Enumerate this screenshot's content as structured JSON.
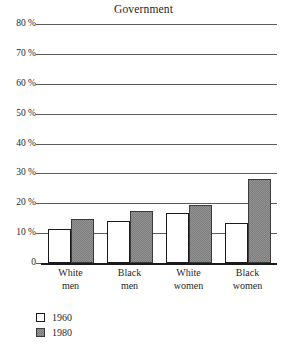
{
  "chart_data": {
    "type": "bar",
    "title": "Government",
    "xlabel": "",
    "ylabel": "",
    "ylim": [
      0,
      80
    ],
    "grid": true,
    "legend_position": "bottom-left",
    "categories": [
      "White men",
      "Black men",
      "White women",
      "Black women"
    ],
    "category_lines": [
      [
        "White",
        "men"
      ],
      [
        "Black",
        "men"
      ],
      [
        "White",
        "women"
      ],
      [
        "Black",
        "women"
      ]
    ],
    "ytick_values": [
      80,
      70,
      60,
      50,
      40,
      30,
      20,
      10,
      0
    ],
    "ytick_labels": [
      "80 %",
      "70 %",
      "60 %",
      "50 %",
      "40 %",
      "30 %",
      "20 %",
      "10 %",
      "0"
    ],
    "series": [
      {
        "name": "1960",
        "color": "#ffffff",
        "values": [
          11.3,
          14.0,
          16.7,
          13.5
        ]
      },
      {
        "name": "1980",
        "color": "#7d7d7d",
        "values": [
          14.7,
          17.5,
          19.5,
          28.0
        ]
      }
    ]
  },
  "legend": {
    "items": [
      {
        "label": "1960",
        "swatch": "white-swatch"
      },
      {
        "label": "1980",
        "swatch": "gray-swatch"
      }
    ]
  },
  "colors": {
    "series_1960": "#ffffff",
    "series_1980": "#7d7d7d",
    "gridline": "#5b5b5b",
    "axis": "#1a1a1a",
    "text": "#1f1f1f",
    "background": "#ffffff"
  }
}
